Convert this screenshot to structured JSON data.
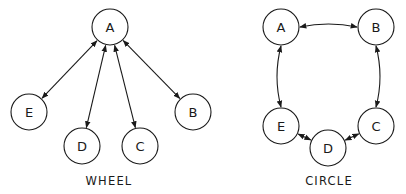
{
  "diagrams": [
    {
      "id": "wheel",
      "caption": "WHEEL",
      "caption_pos": [
        109,
        185
      ],
      "node_radius": 18,
      "nodes": [
        {
          "id": "A",
          "label": "A",
          "x": 110,
          "y": 27
        },
        {
          "id": "B",
          "label": "B",
          "x": 193,
          "y": 112
        },
        {
          "id": "C",
          "label": "C",
          "x": 140,
          "y": 146
        },
        {
          "id": "D",
          "label": "D",
          "x": 82,
          "y": 146
        },
        {
          "id": "E",
          "label": "E",
          "x": 29,
          "y": 112
        }
      ],
      "edges": [
        {
          "from": "A",
          "to": "E",
          "bidirectional": true,
          "curve": 0
        },
        {
          "from": "A",
          "to": "D",
          "bidirectional": true,
          "curve": 0
        },
        {
          "from": "A",
          "to": "C",
          "bidirectional": true,
          "curve": 0
        },
        {
          "from": "A",
          "to": "B",
          "bidirectional": true,
          "curve": 0
        }
      ]
    },
    {
      "id": "circle",
      "caption": "CIRCLE",
      "caption_pos": [
        329,
        185
      ],
      "node_radius": 18,
      "nodes": [
        {
          "id": "A",
          "label": "A",
          "x": 281,
          "y": 27
        },
        {
          "id": "B",
          "label": "B",
          "x": 376,
          "y": 27
        },
        {
          "id": "C",
          "label": "C",
          "x": 376,
          "y": 126
        },
        {
          "id": "D",
          "label": "D",
          "x": 328,
          "y": 148
        },
        {
          "id": "E",
          "label": "E",
          "x": 281,
          "y": 126
        }
      ],
      "edges": [
        {
          "from": "A",
          "to": "B",
          "bidirectional": true,
          "curve": -6
        },
        {
          "from": "B",
          "to": "C",
          "bidirectional": true,
          "curve": -8
        },
        {
          "from": "C",
          "to": "D",
          "bidirectional": true,
          "curve": 0
        },
        {
          "from": "D",
          "to": "E",
          "bidirectional": true,
          "curve": 0
        },
        {
          "from": "E",
          "to": "A",
          "bidirectional": true,
          "curve": -8
        }
      ]
    }
  ],
  "style": {
    "stroke": "#1a1a1a",
    "background": "#ffffff"
  }
}
